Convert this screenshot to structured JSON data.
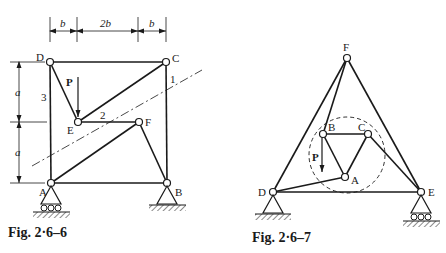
{
  "figures": [
    {
      "id": "fig-2-6-6",
      "caption": "Fig. 2·6–6",
      "nodes": {
        "A": "A",
        "B": "B",
        "C": "C",
        "D": "D",
        "E": "E",
        "F": "F"
      },
      "member_labels": {
        "m1": "1",
        "m2": "2",
        "m3": "3"
      },
      "load_label": "P",
      "dimensions": {
        "top": [
          "b",
          "2b",
          "b"
        ],
        "left": [
          "a",
          "a"
        ]
      }
    },
    {
      "id": "fig-2-6-7",
      "caption": "Fig. 2·6–7",
      "nodes": {
        "A": "A",
        "B": "B",
        "C": "C",
        "D": "D",
        "E": "E",
        "F": "F"
      },
      "load_label": "P"
    }
  ],
  "colors": {
    "ink": "#1a1a1a",
    "background": "#ffffff"
  }
}
